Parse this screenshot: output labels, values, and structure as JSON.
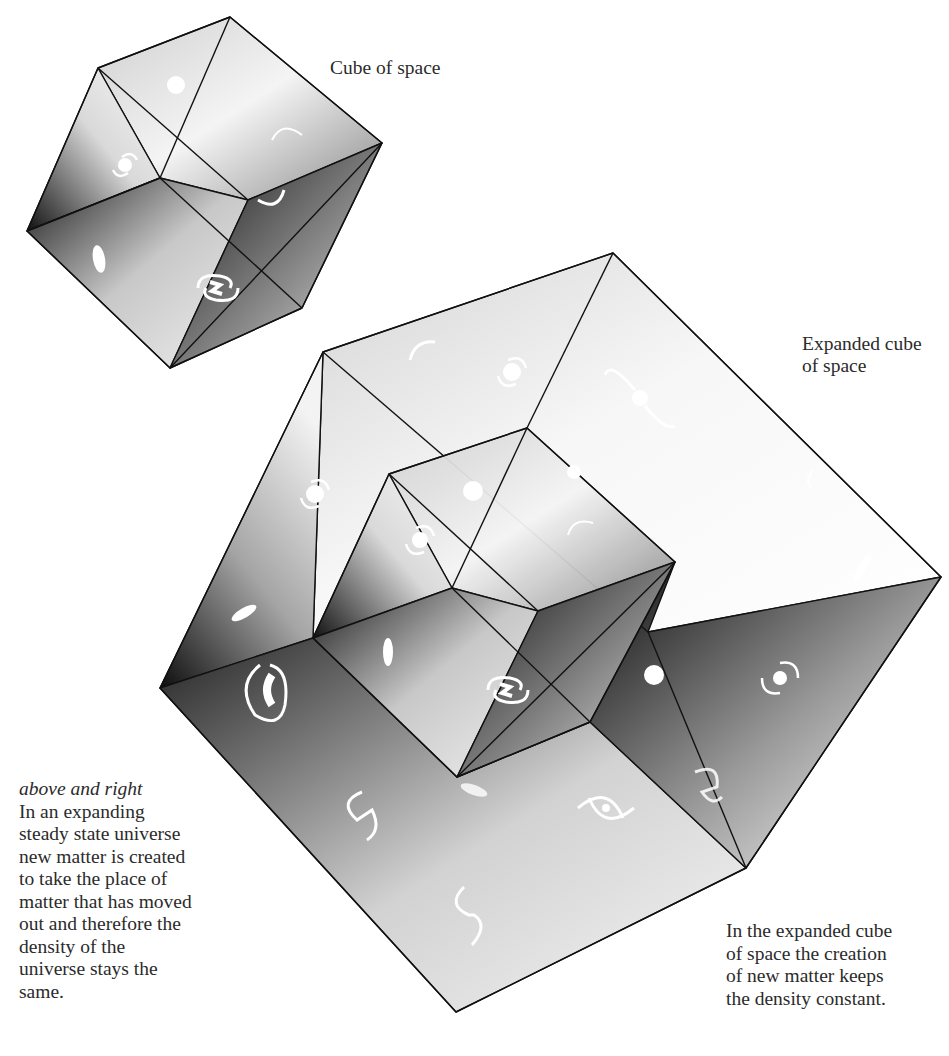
{
  "figure": {
    "small_cube_label": "Cube of space",
    "expanded_cube_label_lines": [
      "Expanded cube",
      "of space"
    ],
    "left_caption": {
      "heading": "above and right",
      "lines": [
        "In an expanding",
        "steady state universe",
        "new matter is created",
        "to take the place of",
        "matter that has moved",
        "out and therefore the",
        "density of the",
        "universe stays the",
        "same."
      ]
    },
    "right_caption": {
      "lines": [
        "In the expanded cube",
        "of space the creation",
        "of new matter keeps",
        "the density constant."
      ]
    },
    "galaxy_icons": [
      "spiral-galaxy-icon",
      "elliptical-galaxy-icon",
      "round-galaxy-icon"
    ],
    "colors": {
      "ink": "#111111",
      "shadow": "#0a0a0a",
      "highlight": "#ffffff",
      "text": "#2b2b2b"
    }
  }
}
